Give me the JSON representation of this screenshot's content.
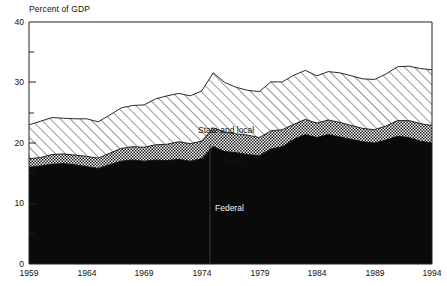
{
  "chart_data": {
    "type": "area",
    "stacked": true,
    "title": "",
    "ylabel": "Percent of GDP",
    "xlabel": "",
    "ylim": [
      0,
      40
    ],
    "xlim": [
      1959,
      1994
    ],
    "yticks": [
      0,
      10,
      20,
      30,
      40
    ],
    "yticks_minor": [
      5,
      15,
      25,
      35
    ],
    "xticks": [
      1959,
      1964,
      1969,
      1974,
      1979,
      1984,
      1989,
      1994
    ],
    "grid": false,
    "legend_position": "inline-annotations",
    "x": [
      1959,
      1960,
      1961,
      1962,
      1963,
      1964,
      1965,
      1966,
      1967,
      1968,
      1969,
      1970,
      1971,
      1972,
      1973,
      1974,
      1975,
      1976,
      1977,
      1978,
      1979,
      1980,
      1981,
      1982,
      1983,
      1984,
      1985,
      1986,
      1987,
      1988,
      1989,
      1990,
      1991,
      1992,
      1993,
      1994
    ],
    "series": [
      {
        "name": "Federal",
        "fill": "solid-black",
        "color": "#0a0a0a",
        "values": [
          16.0,
          16.2,
          16.5,
          16.6,
          16.4,
          16.1,
          15.8,
          16.4,
          17.0,
          17.2,
          17.0,
          17.2,
          17.1,
          17.3,
          17.0,
          17.4,
          19.4,
          18.6,
          18.4,
          18.1,
          17.9,
          19.0,
          19.4,
          20.6,
          21.4,
          20.9,
          21.4,
          21.0,
          20.6,
          20.2,
          20.0,
          20.5,
          21.1,
          20.9,
          20.3,
          20.0
        ]
      },
      {
        "name": "Grants",
        "fill": "crosshatch",
        "color": "#d8d8d8",
        "values": [
          1.4,
          1.4,
          1.6,
          1.6,
          1.6,
          1.7,
          1.7,
          1.9,
          2.1,
          2.2,
          2.3,
          2.5,
          2.7,
          2.9,
          2.9,
          2.9,
          3.1,
          3.2,
          3.1,
          3.2,
          3.0,
          3.0,
          2.8,
          2.5,
          2.5,
          2.4,
          2.4,
          2.4,
          2.3,
          2.2,
          2.2,
          2.3,
          2.6,
          2.8,
          2.9,
          2.9
        ]
      },
      {
        "name": "State and local",
        "fill": "diagonal-hatch",
        "color": "#ffffff",
        "values": [
          5.6,
          6.0,
          6.1,
          5.9,
          6.0,
          6.2,
          6.0,
          6.3,
          6.7,
          6.8,
          7.0,
          7.6,
          8.0,
          8.0,
          7.9,
          8.3,
          9.1,
          8.2,
          7.7,
          7.4,
          7.6,
          8.1,
          7.9,
          8.1,
          8.1,
          7.8,
          8.0,
          8.2,
          8.2,
          8.2,
          8.3,
          8.6,
          8.9,
          9.0,
          9.1,
          9.2
        ]
      }
    ],
    "annotations": [
      {
        "text": "State and local",
        "x": 1979,
        "y": 26.7
      },
      {
        "text": "Grants",
        "x": 1978,
        "y": 19.4
      },
      {
        "text": "Federal",
        "x": 1977,
        "y": 9.6
      }
    ]
  },
  "axis": {
    "y_title": "Percent of GDP",
    "y_tick_labels": [
      "40",
      "30",
      "20",
      "10",
      "0"
    ],
    "x_tick_labels": [
      "1959",
      "1964",
      "1969",
      "1974",
      "1979",
      "1984",
      "1989",
      "1994"
    ]
  },
  "labels": {
    "state_and_local": "State and local",
    "grants": "Grants",
    "federal": "Federal"
  },
  "colors": {
    "federal": "#0a0a0a",
    "grants": "#d8d8d8",
    "state_and_local": "#ffffff",
    "axis": "#222222",
    "text": "#111111"
  }
}
